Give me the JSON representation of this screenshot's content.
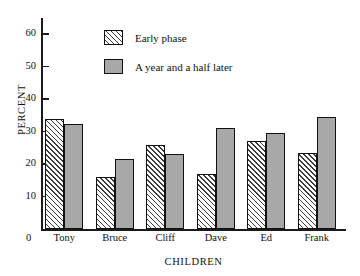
{
  "chart_data": {
    "type": "bar",
    "title": "",
    "xlabel": "CHILDREN",
    "ylabel": "PERCENT",
    "categories": [
      "Tony",
      "Bruce",
      "Cliff",
      "Dave",
      "Ed",
      "Frank"
    ],
    "series": [
      {
        "name": "Early phase",
        "values": [
          34,
          16,
          26,
          17,
          27,
          23.5
        ],
        "fill": "hatched-diagonal",
        "color": "#ffffff"
      },
      {
        "name": "A year and a half later",
        "values": [
          32.5,
          21.5,
          23,
          31,
          29.5,
          34.5
        ],
        "fill": "solid",
        "color": "#a8a8a8"
      }
    ],
    "ylim": [
      0,
      65
    ],
    "yticks": [
      0,
      10,
      20,
      30,
      40,
      50,
      60
    ],
    "ytick_labels": [
      "0",
      "10",
      "20",
      "30",
      "40",
      "50",
      "60"
    ],
    "grid": false,
    "legend_position": "upper-center"
  },
  "axes": {
    "y_title": "PERCENT",
    "x_title": "CHILDREN",
    "zero_label": "0"
  },
  "legend": {
    "items": [
      {
        "label": "Early phase"
      },
      {
        "label": "A year and a half later"
      }
    ]
  },
  "colors": {
    "axis": "#1a1a1a",
    "bar_outline": "#111111",
    "bar_solid_fill": "#a8a8a8",
    "bar_hatch_fill": "#ffffff",
    "background": "#ffffff"
  }
}
